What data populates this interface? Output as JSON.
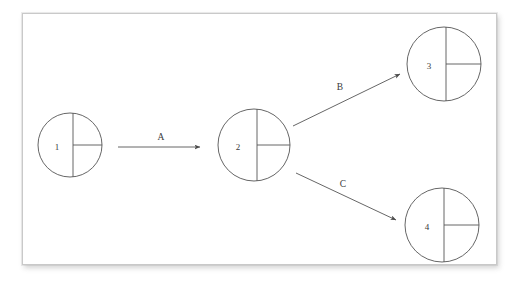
{
  "figure": {
    "type": "state-transition-diagram",
    "background_color": "#ffffff",
    "panel_background": "#ffffff",
    "panel_border_color": "#c9c9c9",
    "stroke_color": "#555555",
    "label_color": "#3a3a3a"
  },
  "nodes": [
    {
      "id": "node-1",
      "label": "1",
      "cx": 70,
      "cy": 145,
      "r": 32,
      "label_x": 57,
      "label_y": 147,
      "divider_x": 73,
      "radius_line": "right"
    },
    {
      "id": "node-2",
      "label": "2",
      "cx": 254,
      "cy": 145,
      "r": 36,
      "label_x": 238,
      "label_y": 147,
      "divider_x": 257,
      "radius_line": "right"
    },
    {
      "id": "node-3",
      "label": "3",
      "cx": 444,
      "cy": 64,
      "r": 37,
      "label_x": 429,
      "label_y": 66,
      "divider_x": 446,
      "radius_line": "right"
    },
    {
      "id": "node-4",
      "label": "4",
      "cx": 442,
      "cy": 225,
      "r": 37,
      "label_x": 427,
      "label_y": 227,
      "divider_x": 444,
      "radius_line": "right"
    }
  ],
  "edges": [
    {
      "id": "edge-a",
      "label": "A",
      "from": "node-1",
      "to": "node-2",
      "x1": 118,
      "y1": 147,
      "x2": 200,
      "y2": 147,
      "label_x": 161,
      "label_y": 138
    },
    {
      "id": "edge-b",
      "label": "B",
      "from": "node-2",
      "to": "node-3",
      "x1": 293,
      "y1": 126,
      "x2": 400,
      "y2": 74,
      "label_x": 340,
      "label_y": 88
    },
    {
      "id": "edge-c",
      "label": "C",
      "from": "node-2",
      "to": "node-4",
      "x1": 296,
      "y1": 173,
      "x2": 396,
      "y2": 220,
      "label_x": 343,
      "label_y": 185
    }
  ]
}
